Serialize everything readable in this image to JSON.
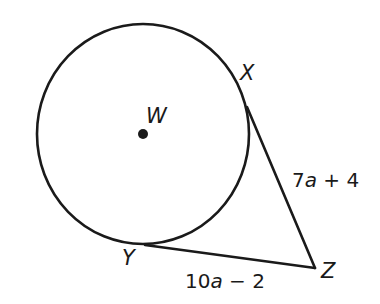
{
  "diagram": {
    "circle": {
      "center_label": "W"
    },
    "points": {
      "X": "X",
      "Y": "Y",
      "Z": "Z"
    },
    "segments": {
      "XZ": {
        "label_num": "7",
        "label_var": "a",
        "label_rest": " + 4"
      },
      "YZ": {
        "label_num": "10",
        "label_var": "a",
        "label_rest": " − 2"
      }
    },
    "colors": {
      "stroke": "#1a1a1a",
      "background": "#ffffff"
    }
  }
}
